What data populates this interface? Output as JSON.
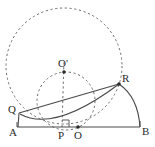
{
  "figure": {
    "type": "geometry-diagram",
    "width": 155,
    "height": 147,
    "colors": {
      "stroke": "#4a4a4a",
      "label": "#2b2b2b",
      "dash": "#6b6b6b",
      "background": "#ffffff"
    },
    "points": [
      {
        "id": "A",
        "label": "A",
        "x": 17,
        "y": 127,
        "label_x": 10,
        "label_y": 128,
        "dot": false
      },
      {
        "id": "B",
        "label": "B",
        "x": 140,
        "y": 127,
        "label_x": 143,
        "label_y": 128,
        "dot": false
      },
      {
        "id": "O",
        "label": "O",
        "x": 78,
        "y": 127,
        "label_x": 75,
        "label_y": 131,
        "dot": true
      },
      {
        "id": "P",
        "label": "P",
        "x": 62,
        "y": 127,
        "label_x": 58,
        "label_y": 131,
        "dot": false
      },
      {
        "id": "Q",
        "label": "Q",
        "x": 19,
        "y": 113,
        "label_x": 8,
        "label_y": 110,
        "dot": false
      },
      {
        "id": "R",
        "label": "R",
        "x": 119,
        "y": 84,
        "label_x": 123,
        "label_y": 76,
        "dot": true
      },
      {
        "id": "Oprime",
        "label": "O'",
        "x": 64,
        "y": 72,
        "label_x": 58,
        "label_y": 58,
        "dot": true
      }
    ],
    "segments": [
      {
        "name": "baseline-AB",
        "from": "A",
        "to": "B"
      },
      {
        "name": "chord-QR",
        "from": "Q",
        "to": "R"
      },
      {
        "name": "segment-QA",
        "from": "Q",
        "to": "A"
      }
    ],
    "arcs": [
      {
        "name": "semicircle-AB",
        "style": "solid",
        "note": "arc from R down to B, part of semicircle on diameter AB centered at O"
      },
      {
        "name": "arc-A-to-R",
        "style": "solid",
        "note": "arc from A curving through lower region up to R"
      }
    ],
    "dashed": [
      {
        "name": "big-circle",
        "cx": 64,
        "cy": 66,
        "r": 58,
        "note": "large dashed circle through Q and R"
      },
      {
        "name": "small-circle",
        "cx": 64,
        "cy": 100,
        "r": 28,
        "note": "dashed circle through Q, O-prime and R region"
      },
      {
        "name": "vertical-PO-prime",
        "from": "P",
        "to": "Oprime",
        "note": "dashed vertical from P up to O'"
      }
    ],
    "markers": [
      {
        "name": "right-angle-at-P",
        "x": 62,
        "y": 127,
        "size": 7
      }
    ]
  }
}
